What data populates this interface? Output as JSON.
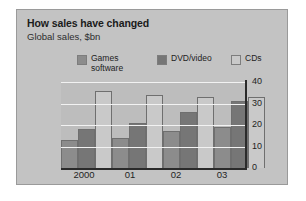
{
  "card": {
    "title": "How sales have changed",
    "subtitle": "Global sales, $bn"
  },
  "legend": {
    "items": [
      {
        "label": "Games\nsoftware",
        "color": "#8c8c8c",
        "swatch_name": "legend-swatch-games-software"
      },
      {
        "label": "DVD/video",
        "color": "#767676",
        "swatch_name": "legend-swatch-dvd-video"
      },
      {
        "label": "CDs",
        "color": "#c9c9c9",
        "swatch_name": "legend-swatch-cds"
      }
    ]
  },
  "chart_data": {
    "type": "bar",
    "title": "How sales have changed",
    "subtitle": "Global sales, $bn",
    "xlabel": "",
    "ylabel": "",
    "ylim": [
      0,
      40
    ],
    "yticks": [
      0,
      10,
      20,
      30,
      40
    ],
    "ytick_labels": [
      "0",
      "10",
      "20",
      "30",
      "40"
    ],
    "grid": true,
    "axis_position": "right",
    "legend_position": "top",
    "categories": [
      "2000",
      "01",
      "02",
      "03"
    ],
    "series": [
      {
        "name": "Games software",
        "color": "#8c8c8c",
        "values": [
          13,
          14,
          17,
          19
        ]
      },
      {
        "name": "DVD/video",
        "color": "#767676",
        "values": [
          18,
          21,
          26,
          31
        ]
      },
      {
        "name": "CDs",
        "color": "#c9c9c9",
        "values": [
          36,
          34,
          33,
          33
        ]
      }
    ]
  }
}
